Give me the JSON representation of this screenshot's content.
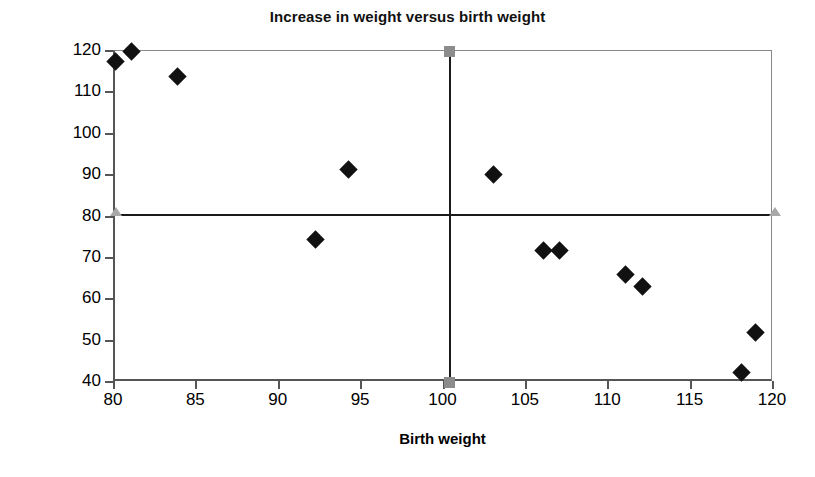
{
  "chart_data": {
    "type": "scatter",
    "title": "Increase in weight versus birth weight",
    "xlabel": "Birth weight",
    "ylabel": "Pct increase, days 70–100",
    "xlim": [
      80,
      120
    ],
    "ylim": [
      40,
      120
    ],
    "xticks": [
      80,
      85,
      90,
      95,
      100,
      105,
      110,
      115,
      120
    ],
    "yticks": [
      40,
      50,
      60,
      70,
      80,
      90,
      100,
      110,
      120
    ],
    "xtick_labels": [
      "80",
      "85",
      "90",
      "95",
      "100",
      "105",
      "110",
      "115",
      "120"
    ],
    "ytick_labels": [
      "40",
      "50",
      "60",
      "70",
      "80",
      "90",
      "100",
      "110",
      "120"
    ],
    "grid": false,
    "legend": "none",
    "marker": "filled-diamond",
    "marker_color": "#111111",
    "points": [
      {
        "x": 80.0,
        "y": 117.5
      },
      {
        "x": 81.0,
        "y": 119.8
      },
      {
        "x": 83.8,
        "y": 113.8
      },
      {
        "x": 92.2,
        "y": 74.5
      },
      {
        "x": 94.2,
        "y": 91.3
      },
      {
        "x": 103.0,
        "y": 90.2
      },
      {
        "x": 106.0,
        "y": 71.8
      },
      {
        "x": 107.0,
        "y": 71.8
      },
      {
        "x": 111.0,
        "y": 66.0
      },
      {
        "x": 112.0,
        "y": 63.2
      },
      {
        "x": 118.0,
        "y": 42.4
      },
      {
        "x": 118.9,
        "y": 52.0
      }
    ],
    "reference_lines": [
      {
        "orientation": "horizontal",
        "value": 80.5,
        "color": "#1a1a1a"
      },
      {
        "orientation": "vertical",
        "value": 100.3,
        "color": "#1a1a1a"
      }
    ],
    "reference_handles": [
      {
        "shape": "triangle-left",
        "x": 80.0,
        "y": 80.5,
        "color": "#a8a8a8"
      },
      {
        "shape": "triangle-right",
        "x": 120.0,
        "y": 80.5,
        "color": "#a8a8a8"
      },
      {
        "shape": "square-top",
        "x": 100.3,
        "y": 120.0,
        "color": "#8c8c8c"
      },
      {
        "shape": "square-bottom",
        "x": 100.3,
        "y": 40.0,
        "color": "#8c8c8c"
      }
    ]
  }
}
